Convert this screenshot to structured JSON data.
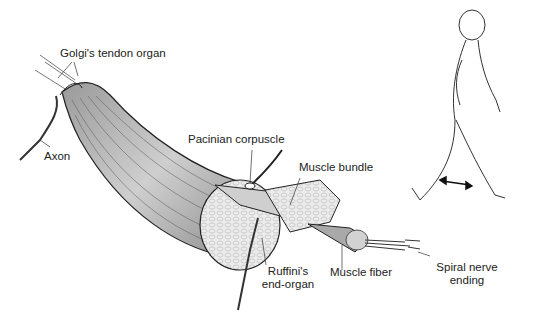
{
  "diagram": {
    "labels": {
      "golgi": "Golgi's tendon organ",
      "axon": "Axon",
      "pacinian": "Pacinian corpuscle",
      "muscle_bundle": "Muscle bundle",
      "ruffini_line1": "Ruffini's",
      "ruffini_line2": "end-organ",
      "muscle_fiber": "Muscle fiber",
      "spiral_line1": "Spiral nerve",
      "spiral_line2": "ending"
    },
    "figure": {
      "subject": "walking human figure outline",
      "indicator": "double-headed arrow showing leg movement"
    },
    "colors": {
      "ink": "#222222",
      "muscle_fill": "#bdbdbd",
      "section_fill": "#e6e6e6",
      "background": "#ffffff"
    }
  }
}
